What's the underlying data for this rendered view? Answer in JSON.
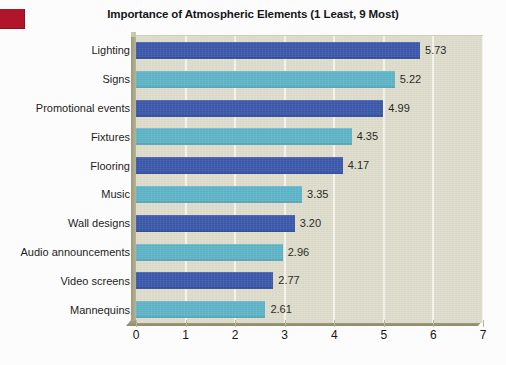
{
  "figure": {
    "title": "Importance of Atmospheric Elements (1 Least, 9 Most)",
    "background_color": "#fcfcfd",
    "plot_background_color": "#dfddcb",
    "corner_mark_color": "#b0152a"
  },
  "chart_data": {
    "type": "bar",
    "orientation": "horizontal",
    "title": "Importance of Atmospheric Elements (1 Least, 9 Most)",
    "xlabel": "",
    "ylabel": "",
    "categories": [
      "Lighting",
      "Signs",
      "Promotional events",
      "Fixtures",
      "Flooring",
      "Music",
      "Wall designs",
      "Audio announcements",
      "Video screens",
      "Mannequins"
    ],
    "values": [
      5.73,
      5.22,
      4.99,
      4.35,
      4.17,
      3.35,
      3.2,
      2.96,
      2.77,
      2.61
    ],
    "value_labels": [
      "5.73",
      "5.22",
      "4.99",
      "4.35",
      "4.17",
      "3.35",
      "3.20",
      "2.96",
      "2.77",
      "2.61"
    ],
    "bar_colors": [
      "#3a57ab",
      "#5eb4c8",
      "#3a57ab",
      "#5eb4c8",
      "#3a57ab",
      "#5eb4c8",
      "#3a57ab",
      "#5eb4c8",
      "#3a57ab",
      "#5eb4c8"
    ],
    "xlim": [
      0,
      7
    ],
    "xticks": [
      0,
      1,
      2,
      3,
      4,
      5,
      6,
      7
    ],
    "xtick_labels": [
      "0",
      "1",
      "2",
      "3",
      "4",
      "5",
      "6",
      "7"
    ],
    "grid": true,
    "grid_axis": "x",
    "legend": null,
    "palette": {
      "primary": "#3a57ab",
      "secondary": "#5eb4c8",
      "gridline": "#f6f5ee",
      "bevel": "#9d9a7c"
    }
  }
}
